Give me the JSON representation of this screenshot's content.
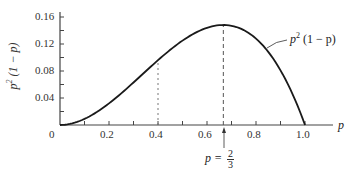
{
  "chart_data": {
    "type": "line",
    "title": "",
    "xlabel": "p",
    "ylabel": "p^2 (1 - p)",
    "xlim": [
      0,
      1.0
    ],
    "ylim": [
      0,
      0.16
    ],
    "x_ticks": [
      0,
      0.2,
      0.4,
      0.6,
      0.8,
      1.0
    ],
    "x_tick_labels": [
      "0",
      "0.2",
      "0.4",
      "0.6",
      "0.8",
      "1.0"
    ],
    "y_ticks": [
      0.04,
      0.08,
      0.12,
      0.16
    ],
    "y_tick_labels": [
      "0.04",
      "0.08",
      "0.12",
      "0.16"
    ],
    "grid": false,
    "series": [
      {
        "name": "p^2 (1 - p)",
        "function": "p^2 (1 - p)",
        "x": [
          0,
          0.1,
          0.2,
          0.3,
          0.4,
          0.5,
          0.6,
          0.667,
          0.7,
          0.8,
          0.9,
          1.0
        ],
        "values": [
          0,
          0.009,
          0.032,
          0.063,
          0.096,
          0.125,
          0.144,
          0.148,
          0.147,
          0.128,
          0.081,
          0
        ]
      }
    ],
    "annotations": [
      {
        "type": "curve-label",
        "text": "p^2 (1 - p)",
        "x": 0.76,
        "y": 0.14
      },
      {
        "type": "vertical-dashed-line",
        "x": 0.667,
        "from": 0,
        "to": 0.148
      },
      {
        "type": "vertical-dotted-line",
        "x": 0.4,
        "from": 0,
        "to": 0.096
      },
      {
        "type": "arrow-label",
        "text": "p = 2/3",
        "x": 0.667
      }
    ]
  },
  "labels": {
    "x_axis": "p",
    "y_axis_base": "p",
    "y_axis_exp": "2",
    "y_axis_rest": "(1 − p)",
    "curve_base": "p",
    "curve_exp": "2",
    "curve_rest": "(1 − p)",
    "max_lhs": "p =",
    "max_num": "2",
    "max_den": "3",
    "origin": "0"
  },
  "colors": {
    "curve": "#1a1a1a",
    "axis": "#444444",
    "dashed": "#555555"
  }
}
